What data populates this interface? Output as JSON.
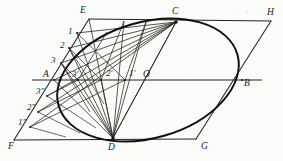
{
  "figure": {
    "type": "geometric-construction",
    "ink_color": "#1d1d1b",
    "paper_color": "#fbfbf9",
    "canvas": {
      "width": 283,
      "height": 161
    },
    "parallelogram": {
      "name": "EFGH",
      "vertices": [
        {
          "id": "E",
          "label": "E",
          "x": 89,
          "y": 19,
          "label_x": 80,
          "label_y": 6
        },
        {
          "id": "H",
          "label": "H",
          "x": 271,
          "y": 21,
          "label_x": 267,
          "label_y": 8
        },
        {
          "id": "G",
          "label": "G",
          "x": 196,
          "y": 139,
          "label_x": 201,
          "label_y": 142
        },
        {
          "id": "F",
          "label": "F",
          "x": 14,
          "y": 140,
          "label_x": 8,
          "label_y": 142
        }
      ]
    },
    "conjugate_diameters": {
      "horizontal": {
        "name": "AB",
        "endpoints": [
          {
            "id": "A",
            "label": "A",
            "x": 54,
            "y": 80,
            "label_x": 43,
            "label_y": 71
          },
          {
            "id": "B",
            "label": "B",
            "x": 242,
            "y": 80,
            "label_x": 244,
            "label_y": 80
          }
        ]
      },
      "oblique": {
        "name": "CD",
        "endpoints": [
          {
            "id": "C",
            "label": "C",
            "x": 176,
            "y": 22,
            "label_x": 172,
            "label_y": 9
          },
          {
            "id": "D",
            "label": "D",
            "x": 113,
            "y": 138,
            "label_x": 108,
            "label_y": 142
          }
        ]
      },
      "center": {
        "id": "O",
        "label": "O",
        "x": 148,
        "y": 80,
        "label_x": 144,
        "label_y": 71
      }
    },
    "division_points": {
      "upper_left_on_EA": [
        {
          "label": "1",
          "x": 77,
          "y": 33,
          "label_x": 68,
          "label_y": 27
        },
        {
          "label": "2",
          "x": 69,
          "y": 48,
          "label_x": 60,
          "label_y": 41
        },
        {
          "label": "3",
          "x": 61,
          "y": 63,
          "label_x": 52,
          "label_y": 56
        }
      ],
      "on_AO_axis": [
        {
          "label": "3'",
          "x": 78,
          "y": 80,
          "label_x": 73,
          "label_y": 71
        },
        {
          "label": "2'",
          "x": 101,
          "y": 80,
          "label_x": 107,
          "label_y": 69
        },
        {
          "label": "1'",
          "x": 125,
          "y": 80,
          "label_x": 129,
          "label_y": 70
        }
      ],
      "lower_left_on_AF": [
        {
          "label": "3\"",
          "x": 47,
          "y": 96,
          "label_x": 37,
          "label_y": 88
        },
        {
          "label": "2\"",
          "x": 38,
          "y": 112,
          "label_x": 28,
          "label_y": 104
        },
        {
          "label": "1\"",
          "x": 30,
          "y": 127,
          "label_x": 19,
          "label_y": 119
        }
      ]
    },
    "construction_rays": {
      "from_C_label": "rays from C to 1, 2, 3 and to 1\", 2\", 3\"",
      "from_D_label": "rays from D to 1, 2, 3 and through 1', 2', 3'"
    },
    "ellipse": {
      "center_x": 148,
      "center_y": 80,
      "semi_major": 93,
      "semi_minor": 58,
      "rotation_deg": -16,
      "stroke_width": 1.9
    }
  }
}
